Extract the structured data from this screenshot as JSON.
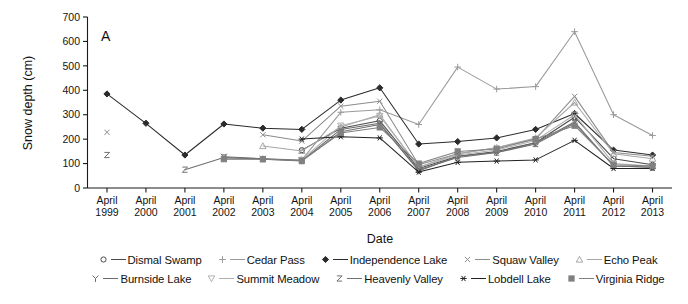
{
  "figure": {
    "panel_label": "A",
    "background": "#ffffff"
  },
  "axes": {
    "ylabel": "Snow depth (cm)",
    "xlabel": "Date",
    "y_ticks": [
      "0",
      "100",
      "200",
      "300",
      "400",
      "500",
      "600",
      "700"
    ],
    "x_tick_lines": [
      [
        "April",
        "1999"
      ],
      [
        "April",
        "2000"
      ],
      [
        "April",
        "2001"
      ],
      [
        "April",
        "2002"
      ],
      [
        "April",
        "2003"
      ],
      [
        "April",
        "2004"
      ],
      [
        "April",
        "2005"
      ],
      [
        "April",
        "2006"
      ],
      [
        "April",
        "2007"
      ],
      [
        "April",
        "2008"
      ],
      [
        "April",
        "2009"
      ],
      [
        "April",
        "2010"
      ],
      [
        "April",
        "2011"
      ],
      [
        "April",
        "2012"
      ],
      [
        "April",
        "2013"
      ]
    ]
  },
  "legend": {
    "rows": [
      [
        {
          "label": "Dismal Swamp",
          "marker": "circle",
          "color": "#4a4a4a"
        },
        {
          "label": "Cedar Pass",
          "marker": "plus",
          "color": "#9a9a9a"
        },
        {
          "label": "Independence Lake",
          "marker": "diamond",
          "color": "#2b2b2b"
        },
        {
          "label": "Squaw Valley",
          "marker": "cross",
          "color": "#8c8c8c"
        },
        {
          "label": "Echo Peak",
          "marker": "triangle-up",
          "color": "#a6a6a6"
        }
      ],
      [
        {
          "label": "Burnside Lake",
          "marker": "y",
          "color": "#6b6b6b"
        },
        {
          "label": "Summit Meadow",
          "marker": "triangle-down",
          "color": "#b0b0b0"
        },
        {
          "label": "Heavenly Valley",
          "marker": "z",
          "color": "#707070"
        },
        {
          "label": "Lobdell Lake",
          "marker": "asterisk",
          "color": "#222222"
        },
        {
          "label": "Virginia Ridge",
          "marker": "square",
          "color": "#808080"
        }
      ]
    ]
  },
  "chart_data": {
    "type": "line",
    "title": "",
    "subtitle": "",
    "xlabel": "Date",
    "ylabel": "Snow depth (cm)",
    "ylim": [
      0,
      700
    ],
    "ytick_step": 100,
    "grid": false,
    "legend_position": "bottom",
    "annotations": [
      "A"
    ],
    "categories": [
      "April 1999",
      "April 2000",
      "April 2001",
      "April 2002",
      "April 2003",
      "April 2004",
      "April 2005",
      "April 2006",
      "April 2007",
      "April 2008",
      "April 2009",
      "April 2010",
      "April 2011",
      "April 2012",
      "April 2013"
    ],
    "series": [
      {
        "name": "Dismal Swamp",
        "marker": "circle",
        "color": "#4a4a4a",
        "values": [
          null,
          null,
          null,
          null,
          null,
          155,
          245,
          275,
          80,
          130,
          150,
          185,
          290,
          120,
          95
        ]
      },
      {
        "name": "Cedar Pass",
        "marker": "plus",
        "color": "#9a9a9a",
        "values": [
          null,
          null,
          null,
          120,
          120,
          115,
          310,
          320,
          260,
          495,
          405,
          415,
          640,
          300,
          215
        ]
      },
      {
        "name": "Independence Lake",
        "marker": "diamond",
        "color": "#2b2b2b",
        "values": [
          385,
          265,
          135,
          262,
          245,
          240,
          360,
          410,
          180,
          190,
          205,
          240,
          305,
          155,
          135
        ]
      },
      {
        "name": "Squaw Valley",
        "marker": "cross",
        "color": "#8c8c8c",
        "values": [
          228,
          null,
          null,
          null,
          218,
          192,
          335,
          355,
          95,
          140,
          165,
          200,
          375,
          145,
          130
        ]
      },
      {
        "name": "Echo Peak",
        "marker": "triangle-up",
        "color": "#a6a6a6",
        "values": [
          null,
          null,
          null,
          null,
          172,
          152,
          250,
          300,
          85,
          140,
          165,
          205,
          350,
          140,
          120
        ]
      },
      {
        "name": "Burnside Lake",
        "marker": "y",
        "color": "#6b6b6b",
        "values": [
          null,
          null,
          null,
          128,
          120,
          112,
          240,
          265,
          70,
          130,
          145,
          185,
          270,
          90,
          85
        ]
      },
      {
        "name": "Summit Meadow",
        "marker": "triangle-down",
        "color": "#b0b0b0",
        "values": [
          null,
          null,
          null,
          null,
          null,
          115,
          255,
          295,
          85,
          135,
          155,
          195,
          300,
          100,
          90
        ]
      },
      {
        "name": "Heavenly Valley",
        "marker": "z",
        "color": "#707070",
        "values": [
          135,
          null,
          75,
          125,
          118,
          110,
          230,
          260,
          75,
          125,
          145,
          180,
          265,
          90,
          85
        ]
      },
      {
        "name": "Lobdell Lake",
        "marker": "asterisk",
        "color": "#222222",
        "values": [
          null,
          null,
          null,
          null,
          null,
          200,
          210,
          205,
          65,
          105,
          110,
          115,
          195,
          80,
          80
        ]
      },
      {
        "name": "Virginia Ridge",
        "marker": "square",
        "color": "#808080",
        "values": [
          null,
          null,
          null,
          118,
          118,
          112,
          225,
          248,
          100,
          150,
          160,
          200,
          255,
          95,
          90
        ]
      }
    ]
  }
}
